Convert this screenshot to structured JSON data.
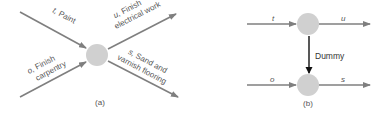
{
  "colors": {
    "arrow": "#7f7f7f",
    "node": "#d0d0d0",
    "dummy_arrow": "#111111",
    "text": "#555555"
  },
  "panel_a": {
    "caption": "(a)",
    "activities": [
      {
        "id": "t",
        "label_letter": "t,",
        "label_text": " Paint",
        "direction": "incoming"
      },
      {
        "id": "o",
        "label_letter": "o,",
        "label_text": " Finish",
        "label_line2": "carpentry",
        "direction": "incoming"
      },
      {
        "id": "u",
        "label_letter": "u,",
        "label_text": " Finish",
        "label_line2": "electrical work",
        "direction": "outgoing"
      },
      {
        "id": "s",
        "label_letter": "s,",
        "label_text": " Sand and",
        "label_line2": "varnish flooring",
        "direction": "outgoing"
      }
    ]
  },
  "panel_b": {
    "caption": "(b)",
    "top_in": "t",
    "top_out": "u",
    "bottom_in": "o",
    "bottom_out": "s",
    "dummy_label": "Dummy"
  }
}
